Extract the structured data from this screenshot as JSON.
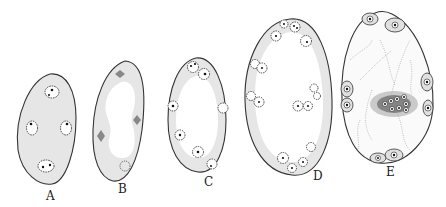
{
  "figure": {
    "type": "scientific-illustration",
    "panels": [
      {
        "id": "A",
        "label": "A",
        "description": "ovoid cell with granular cytoplasm and four nuclei"
      },
      {
        "id": "B",
        "label": "B",
        "description": "elongated sac with large central vacuole and dividing nuclei (spindles)"
      },
      {
        "id": "C",
        "label": "C",
        "description": "oval sac with peripheral nuclei around a central vacuole"
      },
      {
        "id": "D",
        "label": "D",
        "description": "larger oval sac with many peripheral nuclei in thin cytoplasm layer"
      },
      {
        "id": "E",
        "label": "E",
        "description": "egg-shaped sac with cells at poles and a central cluster of nuclei with cytoplasmic strands"
      }
    ]
  }
}
